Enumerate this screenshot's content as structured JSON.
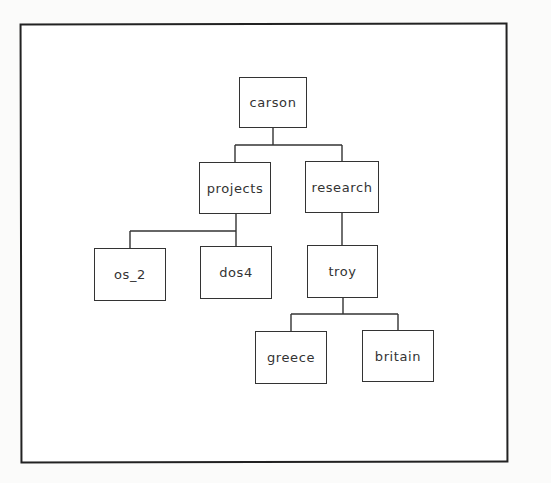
{
  "diagram": {
    "type": "directory-tree",
    "root": "carson",
    "nodes": [
      {
        "id": "carson",
        "label": "carson",
        "parent": null,
        "x": 239,
        "y": 77,
        "w": 68,
        "h": 51
      },
      {
        "id": "projects",
        "label": "projects",
        "parent": "carson",
        "x": 199,
        "y": 162,
        "w": 72,
        "h": 52
      },
      {
        "id": "research",
        "label": "research",
        "parent": "carson",
        "x": 305,
        "y": 161,
        "w": 74,
        "h": 52
      },
      {
        "id": "os_2",
        "label": "os_2",
        "parent": "projects",
        "x": 94,
        "y": 248,
        "w": 72,
        "h": 53
      },
      {
        "id": "dos4",
        "label": "dos4",
        "parent": "projects",
        "x": 200,
        "y": 246,
        "w": 72,
        "h": 53
      },
      {
        "id": "troy",
        "label": "troy",
        "parent": "research",
        "x": 307,
        "y": 245,
        "w": 71,
        "h": 53
      },
      {
        "id": "greece",
        "label": "greece",
        "parent": "troy",
        "x": 255,
        "y": 331,
        "w": 72,
        "h": 53
      },
      {
        "id": "britain",
        "label": "britain",
        "parent": "troy",
        "x": 362,
        "y": 330,
        "w": 72,
        "h": 52
      }
    ]
  }
}
